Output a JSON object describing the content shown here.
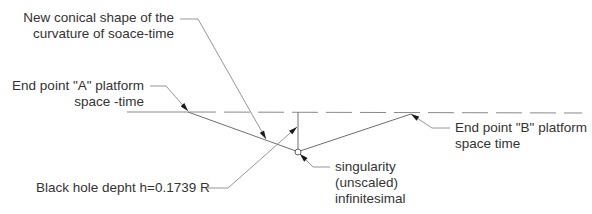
{
  "diagram": {
    "top_cutoff_text": "",
    "labels": {
      "conical_shape": {
        "line1": "New conical shape of the",
        "line2": "curvature of soace-time"
      },
      "end_point_a": {
        "line1": "End point \"A\" platform",
        "line2": "space -time"
      },
      "end_point_b": {
        "line1": "End point \"B\" platform",
        "line2": "space time"
      },
      "black_hole_depth": {
        "line1": "Black hole depht h=0.1739 R"
      },
      "singularity": {
        "line1": "singularity",
        "line2": "(unscaled)",
        "line3": "infinitesimal"
      }
    },
    "colors": {
      "line": "#7a7a7a",
      "arrow": "#1a1a1a",
      "text": "#333333"
    }
  }
}
